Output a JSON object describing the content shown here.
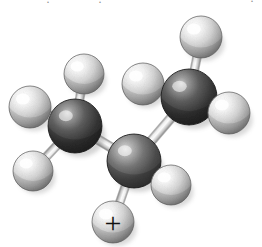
{
  "figure": {
    "kind": "ball-and-stick-molecular-model",
    "rendering": "grayscale-shaded-spheres",
    "background_color": "#ffffff",
    "width": 262,
    "height": 247,
    "molecule_name": "propyl cation",
    "charge_label": "+",
    "top_edge_artifacts": [
      {
        "text": "·",
        "x": 46,
        "y": -5,
        "size": 12
      },
      {
        "text": "·",
        "x": 98,
        "y": -5,
        "size": 12
      },
      {
        "text": "·",
        "x": 250,
        "y": -6,
        "size": 12
      }
    ],
    "colors": {
      "carbon_core": "#4a4a4a",
      "carbon_dark": "#2a2a2a",
      "carbon_highlight": "#d8d8d8",
      "hydrogen_core": "#cfcfcf",
      "hydrogen_dark": "#8a8a8a",
      "hydrogen_highlight": "#ffffff",
      "bond_light": "#f2f2f2",
      "bond_mid": "#cdcdcd",
      "bond_dark": "#8f8f8f",
      "outline": "#5a5a5a",
      "charge_color": "#111111"
    },
    "atoms": [
      {
        "id": "C1",
        "element": "C",
        "label": "carbon-left",
        "x": 75,
        "y": 126,
        "r": 27,
        "depth": "mid",
        "shade": "dark"
      },
      {
        "id": "C2",
        "element": "C",
        "label": "carbon-center",
        "x": 134,
        "y": 161,
        "r": 27,
        "depth": "front",
        "shade": "mid"
      },
      {
        "id": "C3",
        "element": "C",
        "label": "carbon-right",
        "x": 189,
        "y": 97,
        "r": 28,
        "depth": "mid",
        "shade": "dark"
      },
      {
        "id": "H1",
        "element": "H",
        "label": "hydrogen-top-left-of-C1",
        "x": 84,
        "y": 74,
        "r": 20,
        "depth": "back"
      },
      {
        "id": "H2",
        "element": "H",
        "label": "hydrogen-far-left-of-C1",
        "x": 30,
        "y": 107,
        "r": 21,
        "depth": "front"
      },
      {
        "id": "H3",
        "element": "H",
        "label": "hydrogen-lower-left-of-C1",
        "x": 33,
        "y": 171,
        "r": 20,
        "depth": "front"
      },
      {
        "id": "H4",
        "element": "H",
        "label": "hydrogen-upper-mid-of-C3",
        "x": 143,
        "y": 84,
        "r": 21,
        "depth": "back"
      },
      {
        "id": "H5",
        "element": "H",
        "label": "hydrogen-top-of-C3",
        "x": 201,
        "y": 37,
        "r": 21,
        "depth": "back"
      },
      {
        "id": "H6",
        "element": "H",
        "label": "hydrogen-right-of-C3",
        "x": 229,
        "y": 113,
        "r": 21,
        "depth": "front"
      },
      {
        "id": "H7",
        "element": "H",
        "label": "hydrogen-lower-right-of-C2",
        "x": 171,
        "y": 185,
        "r": 20,
        "depth": "front"
      },
      {
        "id": "H8",
        "element": "H",
        "label": "hydrogen-bottom-of-C2-charged",
        "x": 113,
        "y": 222,
        "r": 21,
        "depth": "front",
        "charge": "+"
      }
    ],
    "bonds": [
      {
        "from": "C1",
        "to": "C2",
        "label": "bond-C1-C2",
        "w": 9
      },
      {
        "from": "C2",
        "to": "C3",
        "label": "bond-C2-C3",
        "w": 9
      },
      {
        "from": "C1",
        "to": "H1",
        "label": "bond-C1-H1",
        "w": 8
      },
      {
        "from": "C1",
        "to": "H2",
        "label": "bond-C1-H2",
        "w": 8
      },
      {
        "from": "C1",
        "to": "H3",
        "label": "bond-C1-H3",
        "w": 8
      },
      {
        "from": "C3",
        "to": "H4",
        "label": "bond-C3-H4",
        "w": 8
      },
      {
        "from": "C3",
        "to": "H5",
        "label": "bond-C3-H5",
        "w": 8
      },
      {
        "from": "C3",
        "to": "H6",
        "label": "bond-C3-H6",
        "w": 8
      },
      {
        "from": "C2",
        "to": "H7",
        "label": "bond-C2-H7",
        "w": 8
      },
      {
        "from": "C2",
        "to": "H8",
        "label": "bond-C2-H8",
        "w": 8
      }
    ]
  }
}
